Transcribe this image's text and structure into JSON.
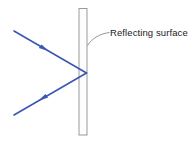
{
  "figure": {
    "background_color": "#ffffff",
    "width": 195,
    "height": 143
  },
  "annotations": [
    {
      "id": "reflecting-surface",
      "text": "Reflecting surface",
      "text_x": 110,
      "text_y": 36,
      "leader_path": "M 109.5 32.5 C 101 33.5 92 38 87.5 45.5",
      "leader_color": "#8a8a8a"
    }
  ],
  "mirror": {
    "name": "reflecting-surface-bar",
    "x": 79,
    "y": 8.5,
    "width": 8,
    "height": 126.5,
    "fill": "#fdfdfd",
    "stroke": "#9a9a9a",
    "stroke_width": 1
  },
  "rays": {
    "color": "#3a57b4",
    "stroke_width": 1.6,
    "incident": {
      "name": "incident-ray",
      "label": "Incident ray",
      "from_x": 14,
      "from_y": 31,
      "to_x": 86.5,
      "to_y": 73,
      "arrow_x": 44,
      "arrow_y": 48.3,
      "direction": "toward-surface"
    },
    "reflected": {
      "name": "reflected-ray",
      "label": "Reflected ray",
      "from_x": 86.5,
      "from_y": 73,
      "to_x": 14,
      "to_y": 115,
      "arrow_x": 44,
      "arrow_y": 97.6,
      "direction": "away-from-surface"
    }
  },
  "incidence_point": {
    "name": "point-of-incidence",
    "x": 86.5,
    "y": 73
  }
}
